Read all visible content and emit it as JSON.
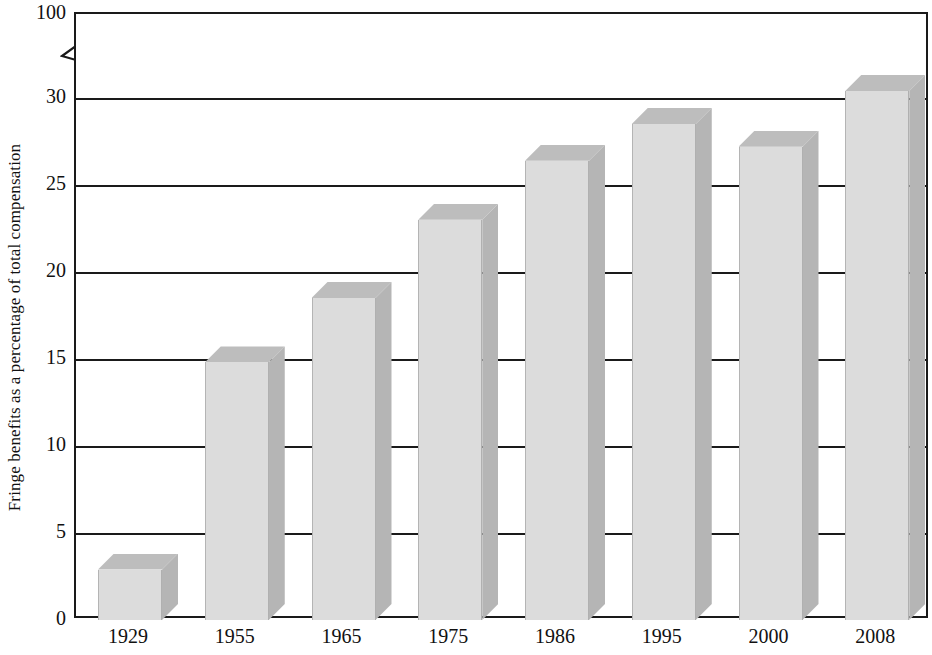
{
  "chart_data": {
    "type": "bar",
    "title": "",
    "subtitle": "",
    "xlabel": "",
    "ylabel": "Fringe benefits as a percentage of total compensation",
    "categories": [
      "1929",
      "1955",
      "1965",
      "1975",
      "1986",
      "1995",
      "2000",
      "2008"
    ],
    "values": [
      2.9,
      14.8,
      18.5,
      23.0,
      26.4,
      28.5,
      27.2,
      30.4
    ],
    "series": [
      {
        "name": "Fringe benefits",
        "values": [
          2.9,
          14.8,
          18.5,
          23.0,
          26.4,
          28.5,
          27.2,
          30.4
        ]
      }
    ],
    "ylim": [
      0,
      30
    ],
    "y_ticks": [
      0,
      5,
      10,
      15,
      20,
      25,
      30,
      100
    ],
    "y_tick_labels": [
      "0",
      "5",
      "10",
      "15",
      "20",
      "25",
      "30",
      "100"
    ],
    "axis_break": {
      "present": true,
      "between": [
        30,
        100
      ],
      "note": "zig-zag break on y-axis above 30"
    },
    "grid": "horizontal",
    "legend": "none",
    "bar_style": "3d-block",
    "colors": {
      "bar_front": "#dcdcdc",
      "bar_top": "#bdbdbd",
      "bar_side": "#b5b5b5",
      "axis": "#1a1a1a",
      "text": "#111111",
      "background": "#ffffff"
    },
    "annotations": []
  }
}
